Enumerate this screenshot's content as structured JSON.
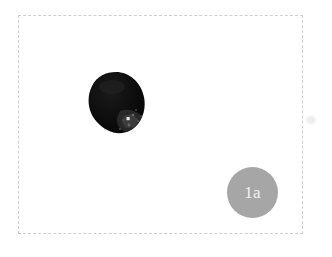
{
  "figure": {
    "background_color": "#ffffff",
    "width": 332,
    "height": 257,
    "frame": {
      "style": "dashed",
      "color": "#cfcfcf",
      "x": 18,
      "y": 15,
      "width": 285,
      "height": 219
    },
    "specimen": {
      "name": "dark-specimen-blob",
      "description": "dark near-black irregular oval specimen",
      "fill_color": "#0d0d0d",
      "texture_color": "#3a3a3a",
      "highlight_color": "#e8e8e8",
      "x": 86,
      "y": 71,
      "width": 62,
      "height": 64
    },
    "badge": {
      "label": "1a",
      "fill_color": "#a6a6a6",
      "text_color": "#f2f2f2",
      "diameter": 51,
      "x": 227,
      "y": 167
    },
    "artifact": {
      "name": "edge-smudge",
      "color": "#ededed"
    }
  }
}
